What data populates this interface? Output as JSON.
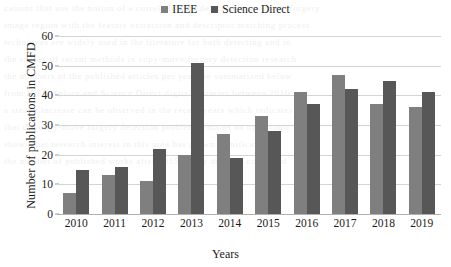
{
  "chart_data": {
    "type": "bar",
    "title": "",
    "xlabel": "Years",
    "ylabel": "Number of publications in CMFD",
    "categories": [
      "2010",
      "2011",
      "2012",
      "2013",
      "2014",
      "2015",
      "2016",
      "2017",
      "2018",
      "2019"
    ],
    "series": [
      {
        "name": "IEEE",
        "color": "#7f7f7f",
        "values": [
          7,
          13,
          11,
          20,
          27,
          33,
          41,
          47,
          37,
          36
        ]
      },
      {
        "name": "Science Direct",
        "color": "#575757",
        "values": [
          15,
          16,
          22,
          51,
          19,
          28,
          37,
          42,
          45,
          41
        ]
      }
    ],
    "ylim": [
      0,
      60
    ],
    "yticks": [
      "0",
      "10",
      "20",
      "30",
      "40",
      "50",
      "60"
    ],
    "grid": true,
    "legend_position": "top-center"
  },
  "legend": {
    "items": [
      {
        "label": "IEEE",
        "marker": "square-marker",
        "color": "#7f7f7f"
      },
      {
        "label": "Science Direct",
        "marker": "square-marker",
        "color": "#575757"
      }
    ]
  },
  "background_text": {
    "lines": [
      "cations that use the  notion of  a  correlation  for  detecting  copy-move  forgery",
      "image  region  with  the  feature  extraction  and  descriptor  matching  process",
      "techniques  are  widely  used  in  the  literature  for  both  detecting  and  in",
      "the  survey  of  recent  methods  in  copy-move  forgery  detection  research",
      "",
      "",
      "",
      "the  numbers  of  the  published  articles  per  year  are  summarized  below",
      "from  IEEE  Xplore  and  Science  Direct  digital  libraries  between  2010",
      "",
      "",
      "",
      "a  steady  increase  can  be  observed  in  the  recent  years  which  indicates",
      "that  the  copy-move  forgery  detection  problem  remains  an  open  topic",
      "",
      "",
      "shows  that  research  interest  in  this  area  has  grown  significantly",
      "the  number  of  published  works  after  2015  nearly  doubled  compared"
    ]
  }
}
